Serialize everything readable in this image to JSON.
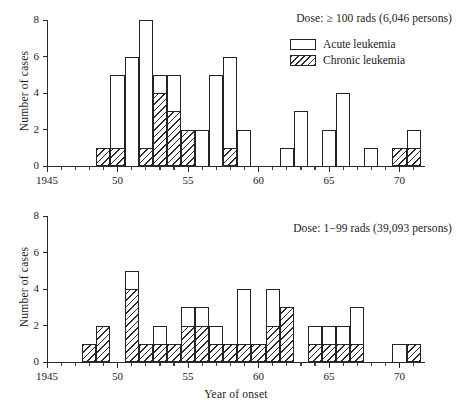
{
  "figure": {
    "title": "",
    "xlabel": "Year of onset",
    "ylabel": "Number of cases"
  },
  "legend": {
    "items": [
      {
        "label": "Acute leukemia",
        "swatch": "open-rectangle",
        "color": "#ffffff"
      },
      {
        "label": "Chronic leukemia",
        "swatch": "hatched-rectangle",
        "color": "#2b2b2b"
      }
    ]
  },
  "axes": {
    "y_ticks": [
      "0",
      "2",
      "4",
      "6",
      "8"
    ],
    "y_values": [
      0,
      2,
      4,
      6,
      8
    ],
    "x_ticks": [
      "1945",
      "50",
      "55",
      "60",
      "65",
      "70"
    ],
    "x_values": [
      1945,
      1950,
      1955,
      1960,
      1965,
      1970
    ],
    "x_minor_values": [
      1946,
      1947,
      1948,
      1949,
      1951,
      1952,
      1953,
      1954,
      1956,
      1957,
      1958,
      1959,
      1961,
      1962,
      1963,
      1964,
      1966,
      1967,
      1968,
      1969,
      1971
    ],
    "ylim": [
      0,
      8
    ],
    "xlim": [
      1945,
      1971.8
    ]
  },
  "panels": [
    {
      "id": "panel-top",
      "dose_note": "Dose: ≥ 100 rads (6,046 persons)",
      "show_legend": true,
      "ylabel": "Number of cases",
      "show_xlabel": false
    },
    {
      "id": "panel-bottom",
      "dose_note": "Dose: 1−99 rads (39,093 persons)",
      "show_legend": false,
      "ylabel": "Number of cases",
      "show_xlabel": true,
      "xlabel": "Year of onset"
    }
  ],
  "chart_data": [
    {
      "type": "bar",
      "title": "Dose: ≥ 100 rads (6,046 persons)",
      "subtitle": "",
      "xlabel": "",
      "ylabel": "Number of cases",
      "ylim": [
        0,
        8
      ],
      "xlim": [
        1945,
        1971.8
      ],
      "grid": false,
      "legend_position": "upper-right",
      "stacked": true,
      "bin_width": 1,
      "bin_offset": -0.5,
      "categories": [
        1949,
        1950,
        1951,
        1952,
        1953,
        1954,
        1955,
        1956,
        1957,
        1958,
        1959,
        1962,
        1963,
        1965,
        1966,
        1968,
        1970,
        1971
      ],
      "series": [
        {
          "name": "Chronic leukemia",
          "values": [
            1,
            1,
            0,
            1,
            4,
            3,
            2,
            0,
            0,
            1,
            0,
            0,
            0,
            0,
            0,
            0,
            1,
            1
          ]
        },
        {
          "name": "Acute leukemia",
          "values": [
            0,
            4,
            6,
            7,
            1,
            2,
            0,
            2,
            5,
            5,
            2,
            1,
            3,
            2,
            4,
            1,
            0,
            1
          ]
        }
      ],
      "totals": [
        1,
        5,
        6,
        8,
        5,
        5,
        2,
        2,
        5,
        6,
        2,
        1,
        3,
        2,
        4,
        1,
        1,
        2
      ]
    },
    {
      "type": "bar",
      "title": "Dose: 1−99 rads (39,093 persons)",
      "subtitle": "",
      "xlabel": "Year of onset",
      "ylabel": "Number of cases",
      "ylim": [
        0,
        8
      ],
      "xlim": [
        1945,
        1971.8
      ],
      "grid": false,
      "legend_position": "none",
      "stacked": true,
      "bin_width": 1,
      "bin_offset": -0.5,
      "categories": [
        1948,
        1949,
        1951,
        1952,
        1953,
        1954,
        1955,
        1956,
        1957,
        1958,
        1959,
        1960,
        1961,
        1962,
        1964,
        1965,
        1966,
        1967,
        1970,
        1971
      ],
      "series": [
        {
          "name": "Chronic leukemia",
          "values": [
            1,
            2,
            4,
            1,
            1,
            1,
            2,
            2,
            1,
            1,
            1,
            1,
            2,
            3,
            1,
            1,
            1,
            1,
            0,
            1
          ]
        },
        {
          "name": "Acute leukemia",
          "values": [
            0,
            0,
            1,
            0,
            1,
            0,
            1,
            1,
            1,
            0,
            3,
            0,
            2,
            0,
            1,
            1,
            1,
            2,
            1,
            0
          ]
        }
      ],
      "totals": [
        1,
        2,
        5,
        1,
        2,
        1,
        3,
        3,
        2,
        1,
        4,
        1,
        4,
        3,
        2,
        2,
        2,
        3,
        1,
        1
      ]
    }
  ]
}
